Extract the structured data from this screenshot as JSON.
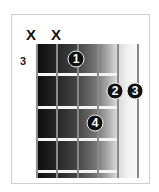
{
  "chord_diagram": {
    "start_fret_label": "3",
    "strings": 6,
    "frets_shown": 4,
    "string_markers": [
      {
        "string": 6,
        "label": "X"
      },
      {
        "string": 5,
        "label": "X"
      }
    ],
    "fingers": [
      {
        "string": 4,
        "fret": 1,
        "label": "1"
      },
      {
        "string": 2,
        "fret": 2,
        "label": "2"
      },
      {
        "string": 1,
        "fret": 2,
        "label": "3"
      },
      {
        "string": 3,
        "fret": 3,
        "label": "4"
      }
    ]
  }
}
